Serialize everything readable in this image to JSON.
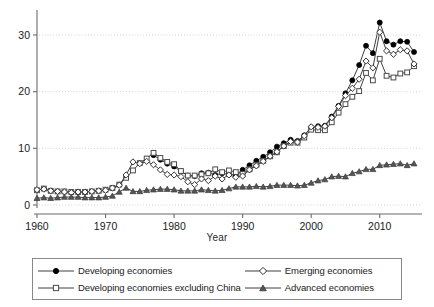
{
  "chart_data": {
    "type": "line",
    "title": "",
    "xlabel": "Year",
    "ylabel": "",
    "xlim": [
      1960,
      2015
    ],
    "ylim": [
      0,
      33
    ],
    "xticks": [
      1960,
      1970,
      1980,
      1990,
      2000,
      2010
    ],
    "yticks": [
      0,
      10,
      20,
      30
    ],
    "grid": "horizontal-dotted",
    "legend_position": "below-plot",
    "x": [
      1960,
      1961,
      1962,
      1963,
      1964,
      1965,
      1966,
      1967,
      1968,
      1969,
      1970,
      1971,
      1972,
      1973,
      1974,
      1975,
      1976,
      1977,
      1978,
      1979,
      1980,
      1981,
      1982,
      1983,
      1984,
      1985,
      1986,
      1987,
      1988,
      1989,
      1990,
      1991,
      1992,
      1993,
      1994,
      1995,
      1996,
      1997,
      1998,
      1999,
      2000,
      2001,
      2002,
      2003,
      2004,
      2005,
      2006,
      2007,
      2008,
      2009,
      2010,
      2011,
      2012,
      2013,
      2014,
      2015
    ],
    "series": [
      {
        "name": "Developing economies",
        "marker": "filled-circle",
        "color": "#000000",
        "x": [
          1977,
          1978,
          1979,
          1980,
          1981,
          1982,
          1983,
          1984,
          1985,
          1986,
          1987,
          1988,
          1989,
          1990,
          1991,
          1992,
          1993,
          1994,
          1995,
          1996,
          1997,
          1998,
          1999,
          2000,
          2001,
          2002,
          2003,
          2004,
          2005,
          2006,
          2007,
          2008,
          2009,
          2010,
          2011,
          2012,
          2013,
          2014,
          2015
        ],
        "values": [
          8.8,
          8.0,
          7.3,
          6.8,
          5.9,
          5.2,
          5.1,
          5.6,
          5.7,
          5.3,
          5.6,
          5.4,
          5.3,
          6.2,
          7.0,
          7.8,
          8.5,
          9.3,
          10.3,
          10.9,
          11.5,
          11.3,
          12.3,
          13.7,
          13.9,
          14.0,
          15.6,
          17.5,
          19.7,
          22.0,
          24.7,
          28.1,
          26.8,
          32.2,
          28.9,
          28.3,
          28.9,
          28.8,
          27.0
        ]
      },
      {
        "name": "Developing economies excluding China",
        "marker": "open-square",
        "color": "#4a4a4a",
        "x": [
          1960,
          1961,
          1962,
          1963,
          1964,
          1965,
          1966,
          1967,
          1968,
          1969,
          1970,
          1971,
          1972,
          1973,
          1974,
          1975,
          1976,
          1977,
          1978,
          1979,
          1980,
          1981,
          1982,
          1983,
          1984,
          1985,
          1986,
          1987,
          1988,
          1989,
          1990,
          1991,
          1992,
          1993,
          1994,
          1995,
          1996,
          1997,
          1998,
          1999,
          2000,
          2001,
          2002,
          2003,
          2004,
          2005,
          2006,
          2007,
          2008,
          2009,
          2010,
          2011,
          2012,
          2013,
          2014,
          2015
        ],
        "values": [
          2.6,
          2.9,
          2.5,
          2.4,
          2.4,
          2.3,
          2.3,
          2.3,
          2.4,
          2.5,
          2.7,
          3.0,
          3.6,
          4.8,
          6.1,
          7.4,
          8.2,
          9.2,
          8.3,
          7.6,
          7.2,
          6.0,
          5.2,
          5.2,
          5.4,
          5.6,
          6.3,
          5.8,
          6.1,
          5.8,
          5.5,
          6.3,
          7.1,
          7.8,
          8.6,
          9.3,
          10.4,
          11.0,
          11.0,
          11.9,
          13.3,
          13.2,
          13.2,
          14.6,
          16.3,
          17.8,
          19.1,
          20.1,
          23.3,
          22.0,
          25.8,
          22.8,
          22.5,
          23.2,
          23.4,
          24.5
        ]
      },
      {
        "name": "Emerging economies",
        "marker": "open-diamond",
        "color": "#333333",
        "x": [
          1960,
          1961,
          1962,
          1963,
          1964,
          1965,
          1966,
          1967,
          1968,
          1969,
          1970,
          1971,
          1972,
          1973,
          1974,
          1975,
          1976,
          1977,
          1978,
          1979,
          1980,
          1981,
          1982,
          1983,
          1984,
          1985,
          1986,
          1987,
          1988,
          1989,
          1990,
          1991,
          1992,
          1993,
          1994,
          1995,
          1996,
          1997,
          1998,
          1999,
          2000,
          2001,
          2002,
          2003,
          2004,
          2005,
          2006,
          2007,
          2008,
          2009,
          2010,
          2011,
          2012,
          2013,
          2014,
          2015
        ],
        "values": [
          2.7,
          2.8,
          2.5,
          2.4,
          2.3,
          2.2,
          2.3,
          2.3,
          2.4,
          2.5,
          2.6,
          3.0,
          3.5,
          5.3,
          7.6,
          7.3,
          7.7,
          7.1,
          6.2,
          5.4,
          5.3,
          5.0,
          4.1,
          3.6,
          4.6,
          4.3,
          5.1,
          4.6,
          5.3,
          4.9,
          5.1,
          6.2,
          6.9,
          7.7,
          8.6,
          9.4,
          10.4,
          11.2,
          11.1,
          12.2,
          13.8,
          13.7,
          13.9,
          15.4,
          17.4,
          19.3,
          20.6,
          22.2,
          25.4,
          24.2,
          30.5,
          27.2,
          26.6,
          27.4,
          27.2,
          24.9
        ]
      },
      {
        "name": "Advanced economies",
        "marker": "filled-triangle",
        "color": "#555555",
        "x": [
          1960,
          1961,
          1962,
          1963,
          1964,
          1965,
          1966,
          1967,
          1968,
          1969,
          1970,
          1971,
          1972,
          1973,
          1974,
          1975,
          1976,
          1977,
          1978,
          1979,
          1980,
          1981,
          1982,
          1983,
          1984,
          1985,
          1986,
          1987,
          1988,
          1989,
          1990,
          1991,
          1992,
          1993,
          1994,
          1995,
          1996,
          1997,
          1998,
          1999,
          2000,
          2001,
          2002,
          2003,
          2004,
          2005,
          2006,
          2007,
          2008,
          2009,
          2010,
          2011,
          2012,
          2013,
          2014,
          2015
        ],
        "values": [
          1.2,
          1.3,
          1.2,
          1.3,
          1.4,
          1.4,
          1.4,
          1.3,
          1.3,
          1.3,
          1.4,
          1.6,
          2.3,
          3.0,
          2.4,
          2.4,
          2.6,
          2.7,
          2.8,
          2.8,
          2.7,
          2.5,
          2.5,
          2.5,
          2.7,
          2.6,
          2.5,
          2.6,
          2.9,
          3.2,
          3.2,
          3.2,
          3.3,
          3.2,
          3.3,
          3.5,
          3.5,
          3.5,
          3.4,
          3.5,
          3.9,
          4.3,
          4.5,
          5.0,
          5.1,
          5.0,
          5.6,
          5.9,
          6.3,
          6.3,
          7.0,
          7.1,
          7.2,
          7.3,
          7.0,
          7.3
        ]
      }
    ]
  },
  "axis": {
    "x_label": "Year",
    "x_tick_labels": [
      "1960",
      "1970",
      "1980",
      "1990",
      "2000",
      "2010"
    ],
    "y_tick_labels": [
      "0",
      "10",
      "20",
      "30"
    ]
  },
  "legend": {
    "entries": [
      {
        "label": "Developing economies",
        "marker": "filled-circle"
      },
      {
        "label": "Emerging economies",
        "marker": "open-diamond"
      },
      {
        "label": "Developing economies excluding China",
        "marker": "open-square"
      },
      {
        "label": "Advanced economies",
        "marker": "filled-triangle"
      }
    ]
  },
  "colors": {
    "axis": "#6b6b6b",
    "grid": "#b9b9b9",
    "line": "#3f3f3f",
    "text": "#1a1a1a",
    "legend_border": "#8a8a8a"
  }
}
